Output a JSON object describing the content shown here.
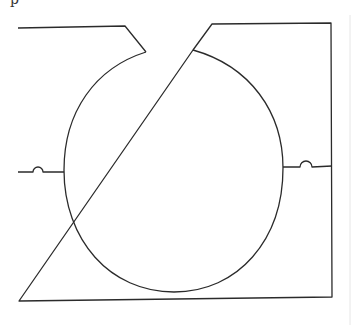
{
  "figure": {
    "caption_fragment": "p",
    "stroke_color": "#2b2b2b",
    "background": "#ffffff"
  }
}
